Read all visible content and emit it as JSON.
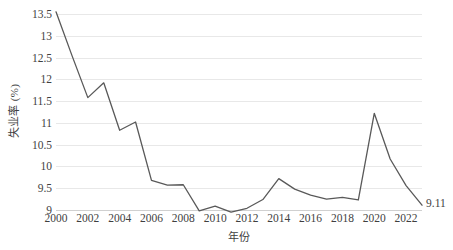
{
  "chart_data": {
    "type": "line",
    "title": "",
    "xlabel": "年份",
    "ylabel": "失业率 (%)",
    "x": [
      2000,
      2001,
      2002,
      2003,
      2004,
      2005,
      2006,
      2007,
      2008,
      2009,
      2010,
      2011,
      2012,
      2013,
      2014,
      2015,
      2016,
      2017,
      2018,
      2019,
      2020,
      2021,
      2022,
      2023
    ],
    "values": [
      13.55,
      12.55,
      11.58,
      11.92,
      10.83,
      11.02,
      9.68,
      9.57,
      9.58,
      8.98,
      9.09,
      8.95,
      9.04,
      9.24,
      9.72,
      9.48,
      9.34,
      9.25,
      9.29,
      9.23,
      11.22,
      10.17,
      9.56,
      9.11
    ],
    "series": [
      {
        "name": "失业率",
        "color": "#595959",
        "values": [
          13.55,
          12.55,
          11.58,
          11.92,
          10.83,
          11.02,
          9.68,
          9.57,
          9.58,
          8.98,
          9.09,
          8.95,
          9.04,
          9.24,
          9.72,
          9.48,
          9.34,
          9.25,
          9.29,
          9.23,
          11.22,
          10.17,
          9.56,
          9.11
        ]
      }
    ],
    "xlim": [
      2000,
      2023
    ],
    "ylim": [
      9,
      13.5
    ],
    "y_ticks": [
      9,
      9.5,
      10,
      10.5,
      11,
      11.5,
      12,
      12.5,
      13,
      13.5
    ],
    "y_tick_labels": [
      "9",
      "9.5",
      "10",
      "10.5",
      "11",
      "11.5",
      "12",
      "12.5",
      "13",
      "13.5"
    ],
    "x_ticks": [
      2000,
      2002,
      2004,
      2006,
      2008,
      2010,
      2012,
      2014,
      2016,
      2018,
      2020,
      2022
    ],
    "x_tick_labels": [
      "2000",
      "2002",
      "2004",
      "2006",
      "2008",
      "2010",
      "2012",
      "2014",
      "2016",
      "2018",
      "2020",
      "2022"
    ],
    "grid": true,
    "grid_axis": "y",
    "grid_color": "#e8e8e8",
    "legend": false,
    "legend_position": "none",
    "annotations": [
      {
        "label": "9.11",
        "x": 2023,
        "y": 9.11
      }
    ],
    "data_labels": [
      "9.11"
    ],
    "line_color": "#595959",
    "background_color": "#ffffff",
    "markers": false
  },
  "axis": {
    "y_title": "失业率 (%)",
    "x_title": "年份"
  },
  "caption": {
    "text": ""
  }
}
